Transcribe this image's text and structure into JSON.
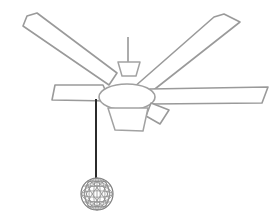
{
  "artwork": {
    "title": "Ceiling Fan",
    "subject": "ceiling-fan-line-drawing",
    "style": "black-and-white line art",
    "background_color": "#ffffff",
    "outline_color": "#9a9a9a",
    "cord_color": "#2b2b2b",
    "orb_line_color": "#8c8c8c",
    "canvas": {
      "width": 274,
      "height": 224
    }
  },
  "parts": {
    "downrod": {
      "name": "downrod",
      "label": "Downrod",
      "x": 128,
      "y_top": 37,
      "y_bottom": 63
    },
    "canopy": {
      "name": "motor-canopy",
      "label": "Motor canopy",
      "shape": "trapezoid"
    },
    "hub": {
      "name": "motor-hub",
      "label": "Motor housing",
      "shape": "ellipse",
      "cx": 127,
      "cy": 97,
      "rx": 28,
      "ry": 13
    },
    "light_kit": {
      "name": "light-kit",
      "label": "Light fixture",
      "shape": "trapezoid"
    },
    "pull_cord": {
      "name": "pull-cord",
      "label": "Pull chain cord",
      "x": 96,
      "y_top": 99,
      "y_bottom": 184
    },
    "orb": {
      "name": "pull-chain-orb",
      "label": "Lattice sphere pull",
      "cx": 97,
      "cy": 194,
      "r": 16,
      "mesh_latitudes": 5,
      "mesh_longitudes": 7
    }
  },
  "blades": [
    {
      "name": "blade-upper-left",
      "label": "Upper left blade",
      "direction": "up-left",
      "points": "27,16 37,13 117,73 109,85 23,26"
    },
    {
      "name": "blade-upper-right",
      "label": "Upper right blade",
      "direction": "up-right",
      "points": "224,14 240,22 146,96 133,88 214,17"
    },
    {
      "name": "blade-left-horizontal",
      "label": "Left horizontal blade",
      "direction": "left",
      "points": "55,85 103,85 110,101 52,100"
    },
    {
      "name": "blade-right-horizontal",
      "label": "Right horizontal blade",
      "direction": "right",
      "points": "150,89 268,87 262,103 151,104"
    },
    {
      "name": "blade-lower-right",
      "label": "Lower right stub blade",
      "direction": "down-right",
      "points": "151,103 169,110 160,124 146,116"
    }
  ]
}
